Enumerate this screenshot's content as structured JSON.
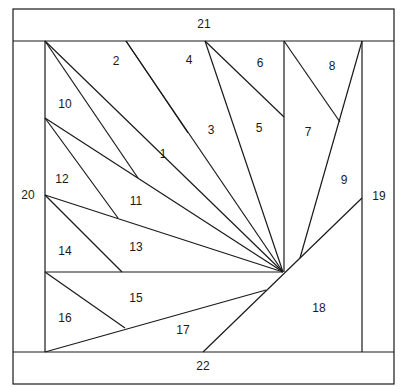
{
  "piece_labels": [
    "1",
    "2",
    "3",
    "4",
    "5",
    "6",
    "7",
    "8",
    "9",
    "10",
    "11",
    "12",
    "13",
    "14",
    "15",
    "16",
    "17",
    "18",
    "19",
    "20",
    "21",
    "22"
  ],
  "colors": {
    "line": "#1a1a1a",
    "background": "#ffffff"
  }
}
